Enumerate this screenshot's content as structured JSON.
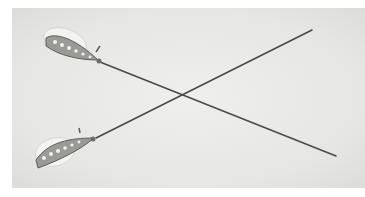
{
  "image": {
    "subject": "Two crossed antique jeweled hatpins on a light grey background",
    "alt": "Photograph of two hatpins with jeweled, pear-shaped heads crossing each other diagonally",
    "colors": {
      "background": "#e8e8e6",
      "border": "#ffffff",
      "pin_shaft": "#4a4a48",
      "jewel_head": "#f4f4f2",
      "setting": "#6d6d6a"
    },
    "objects": [
      {
        "name": "hatpin-upper",
        "head_position": [
          45,
          35
        ],
        "tip_position": [
          335,
          155
        ]
      },
      {
        "name": "hatpin-lower",
        "head_position": [
          42,
          155
        ],
        "tip_position": [
          312,
          30
        ]
      }
    ]
  }
}
